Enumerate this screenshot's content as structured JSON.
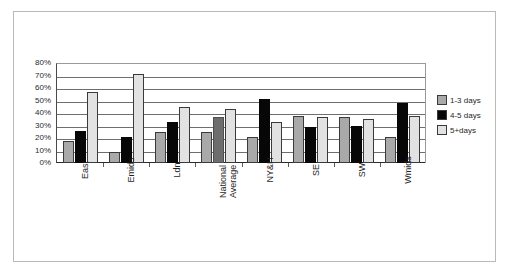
{
  "chart_data": {
    "type": "bar",
    "title": "",
    "subtitle": "",
    "xlabel": "",
    "ylabel": "",
    "ylim": [
      0,
      80
    ],
    "ytick_step": 10,
    "grid": true,
    "grid_axis": "y",
    "legend_position": "right",
    "orientation": "vertical",
    "value_format": "percent",
    "categories": [
      "East",
      "Emids",
      "Ldn",
      "National Average",
      "NY&H",
      "SE",
      "SW",
      "Wmids"
    ],
    "ytick_labels": [
      "80%",
      "70%",
      "60%",
      "50%",
      "40%",
      "30%",
      "20%",
      "10%",
      "0%"
    ],
    "ytick_values": [
      80,
      70,
      60,
      50,
      40,
      30,
      20,
      10,
      0
    ],
    "series": [
      {
        "name": "1-3 days",
        "color": "#a9a9a9",
        "values": [
          18,
          9,
          25,
          25,
          21,
          38,
          37,
          21
        ]
      },
      {
        "name": "4-5 days",
        "color": "#070707",
        "values": [
          26,
          21,
          33,
          37,
          51,
          29,
          30,
          48
        ]
      },
      {
        "name": "5+days",
        "color": "#e2e2e2",
        "values": [
          57,
          71,
          45,
          43,
          33,
          37,
          35,
          38
        ]
      }
    ],
    "highlight_category": "National Average",
    "annotations": []
  },
  "legend": {
    "items": [
      {
        "label": "1-3 days",
        "swatch": "#a9a9a9"
      },
      {
        "label": "4-5 days",
        "swatch": "#070707"
      },
      {
        "label": "5+days",
        "swatch": "#e2e2e2"
      }
    ]
  },
  "colors": {
    "frame_border": "#b9b9b9",
    "gridline": "#6e6e6e",
    "axis": "#2b2b2b",
    "background": "#ffffff"
  }
}
